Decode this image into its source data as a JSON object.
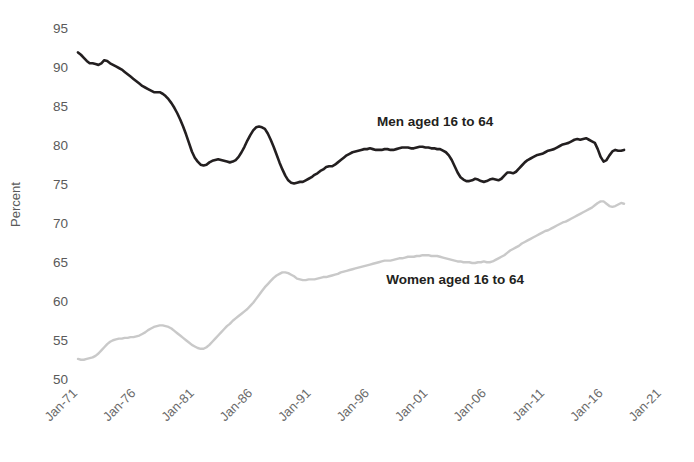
{
  "chart_data": {
    "type": "line",
    "title": "",
    "subtitle": "",
    "xlabel": "",
    "ylabel": "Percent",
    "ylim": [
      50,
      95
    ],
    "ytick_step": 5,
    "yticks": [
      50,
      55,
      60,
      65,
      70,
      75,
      80,
      85,
      90,
      95
    ],
    "grid": false,
    "legend_position": "inline-annotation",
    "x_start_label": "Jan-71",
    "x_end_label": "Jan-22",
    "x_tick_step_years": 5,
    "x_range_years": [
      1971,
      2022.2
    ],
    "xticks": [
      "Jan-71",
      "Jan-76",
      "Jan-81",
      "Jan-86",
      "Jan-91",
      "Jan-96",
      "Jan-01",
      "Jan-06",
      "Jan-11",
      "Jan-16",
      "Jan-21"
    ],
    "xtick_years": [
      1971,
      1976,
      1981,
      1986,
      1991,
      1996,
      2001,
      2006,
      2011,
      2016,
      2021
    ],
    "annotations": [
      {
        "text": "Men aged 16 to 64",
        "x_year": 1996.6,
        "y_value": 82.6
      },
      {
        "text": "Women aged 16 to 64",
        "x_year": 1997.4,
        "y_value": 62.3
      }
    ],
    "series": [
      {
        "name": "Men aged 16 to 64",
        "color": "#231f20",
        "stroke_width": 2.6,
        "x_start_year": 1971.0,
        "x_step_years": 0.25,
        "values": [
          92.0,
          91.7,
          91.3,
          90.9,
          90.6,
          90.6,
          90.5,
          90.4,
          90.6,
          91.0,
          90.9,
          90.6,
          90.4,
          90.2,
          90.0,
          89.8,
          89.5,
          89.2,
          88.9,
          88.6,
          88.3,
          88.0,
          87.7,
          87.5,
          87.3,
          87.1,
          86.9,
          86.9,
          86.9,
          86.7,
          86.4,
          86.0,
          85.5,
          84.9,
          84.2,
          83.4,
          82.5,
          81.5,
          80.4,
          79.3,
          78.5,
          78.0,
          77.6,
          77.5,
          77.6,
          77.9,
          78.1,
          78.2,
          78.3,
          78.2,
          78.1,
          78.0,
          77.9,
          78.0,
          78.2,
          78.6,
          79.2,
          79.9,
          80.7,
          81.4,
          82.0,
          82.4,
          82.5,
          82.4,
          82.2,
          81.6,
          80.8,
          79.9,
          78.9,
          77.9,
          77.0,
          76.2,
          75.6,
          75.3,
          75.2,
          75.3,
          75.4,
          75.4,
          75.6,
          75.8,
          76.0,
          76.3,
          76.5,
          76.8,
          77.0,
          77.3,
          77.4,
          77.4,
          77.6,
          77.9,
          78.2,
          78.5,
          78.8,
          79.0,
          79.2,
          79.3,
          79.4,
          79.5,
          79.6,
          79.6,
          79.7,
          79.6,
          79.5,
          79.5,
          79.5,
          79.6,
          79.6,
          79.5,
          79.5,
          79.6,
          79.7,
          79.8,
          79.8,
          79.8,
          79.7,
          79.7,
          79.8,
          79.9,
          79.9,
          79.8,
          79.8,
          79.7,
          79.7,
          79.6,
          79.6,
          79.4,
          79.2,
          78.8,
          78.2,
          77.4,
          76.6,
          76.0,
          75.7,
          75.5,
          75.5,
          75.6,
          75.8,
          75.7,
          75.5,
          75.4,
          75.5,
          75.7,
          75.8,
          75.7,
          75.6,
          75.8,
          76.2,
          76.6,
          76.6,
          76.5,
          76.7,
          77.1,
          77.5,
          77.9,
          78.2,
          78.4,
          78.6,
          78.8,
          78.9,
          79.0,
          79.2,
          79.4,
          79.5,
          79.6,
          79.8,
          80.0,
          80.2,
          80.3,
          80.4,
          80.6,
          80.8,
          80.9,
          80.8,
          80.9,
          81.0,
          80.8,
          80.6,
          80.4,
          79.6,
          78.6,
          78.0,
          78.2,
          78.8,
          79.3,
          79.5,
          79.4,
          79.4,
          79.5
        ]
      },
      {
        "name": "Women aged 16 to 64",
        "color": "#c9c9c9",
        "stroke_width": 2.4,
        "x_start_year": 1971.0,
        "x_step_years": 0.25,
        "values": [
          52.7,
          52.6,
          52.6,
          52.7,
          52.8,
          52.9,
          53.1,
          53.4,
          53.8,
          54.2,
          54.6,
          54.9,
          55.1,
          55.2,
          55.3,
          55.3,
          55.4,
          55.4,
          55.5,
          55.5,
          55.6,
          55.7,
          55.9,
          56.1,
          56.4,
          56.6,
          56.8,
          56.9,
          57.0,
          57.0,
          56.9,
          56.8,
          56.6,
          56.3,
          56.0,
          55.7,
          55.4,
          55.1,
          54.8,
          54.5,
          54.3,
          54.1,
          54.0,
          54.0,
          54.2,
          54.5,
          54.9,
          55.3,
          55.7,
          56.1,
          56.5,
          56.9,
          57.2,
          57.6,
          57.9,
          58.2,
          58.5,
          58.8,
          59.1,
          59.5,
          59.9,
          60.4,
          60.9,
          61.4,
          61.9,
          62.3,
          62.7,
          63.1,
          63.4,
          63.6,
          63.8,
          63.8,
          63.7,
          63.5,
          63.3,
          63.0,
          62.9,
          62.8,
          62.8,
          62.9,
          62.9,
          62.9,
          63.0,
          63.1,
          63.2,
          63.2,
          63.3,
          63.4,
          63.5,
          63.6,
          63.8,
          63.9,
          64.0,
          64.1,
          64.2,
          64.3,
          64.4,
          64.5,
          64.6,
          64.7,
          64.8,
          64.9,
          65.0,
          65.1,
          65.2,
          65.3,
          65.3,
          65.3,
          65.4,
          65.5,
          65.6,
          65.6,
          65.7,
          65.8,
          65.8,
          65.8,
          65.9,
          65.9,
          66.0,
          66.0,
          66.0,
          65.9,
          65.9,
          65.9,
          65.8,
          65.7,
          65.6,
          65.5,
          65.4,
          65.3,
          65.2,
          65.2,
          65.1,
          65.1,
          65.1,
          65.0,
          65.0,
          65.1,
          65.1,
          65.2,
          65.1,
          65.1,
          65.2,
          65.4,
          65.6,
          65.8,
          66.0,
          66.3,
          66.6,
          66.8,
          67.0,
          67.2,
          67.5,
          67.7,
          67.9,
          68.1,
          68.3,
          68.5,
          68.7,
          68.9,
          69.1,
          69.2,
          69.4,
          69.6,
          69.8,
          70.0,
          70.2,
          70.3,
          70.5,
          70.7,
          70.9,
          71.1,
          71.3,
          71.5,
          71.7,
          71.9,
          72.1,
          72.4,
          72.7,
          72.9,
          72.9,
          72.6,
          72.3,
          72.2,
          72.3,
          72.5,
          72.7,
          72.6
        ]
      }
    ]
  },
  "plot_area": {
    "left": 78,
    "right": 676,
    "top": 29,
    "bottom": 380
  }
}
